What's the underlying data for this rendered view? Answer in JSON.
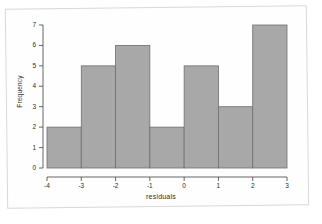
{
  "figure": {
    "kind": "histogram-figure",
    "background_color": "#ffffff",
    "page_border_color": "#d8d8d8"
  },
  "chart_data": {
    "type": "bar",
    "title": "",
    "subtitle": "",
    "xlabel": "residuals",
    "ylabel": "Frequency",
    "bin_edges": [
      -4,
      -3,
      -2,
      -1,
      0,
      1,
      2,
      3
    ],
    "categories": [
      "-4 to -3",
      "-3 to -2",
      "-2 to -1",
      "-1 to 0",
      "0 to 1",
      "1 to 2",
      "2 to 3"
    ],
    "values": [
      2,
      5,
      6,
      2,
      5,
      3,
      7
    ],
    "xlim": [
      -4,
      3
    ],
    "ylim": [
      0,
      7
    ],
    "xticks": [
      "-4",
      "-3",
      "-2",
      "-1",
      "0",
      "1",
      "2",
      "3"
    ],
    "yticks": [
      "0",
      "1",
      "2",
      "3",
      "4",
      "5",
      "6",
      "7"
    ],
    "grid": false,
    "legend": false,
    "legend_position": "none",
    "bar_fill_color": "#a8a8a8",
    "bar_border_color": "#6e6e6e",
    "axis_color": "#555555"
  }
}
